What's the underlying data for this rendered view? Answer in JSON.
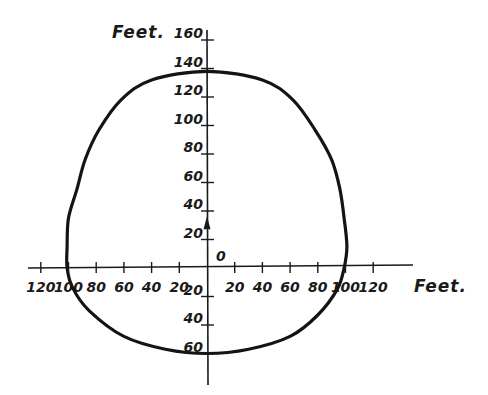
{
  "chart_data": {
    "type": "line",
    "title": "",
    "xlabel": "Feet.",
    "ylabel": "Feet.",
    "origin_label": "0",
    "xlim": [
      -130,
      150
    ],
    "ylim": [
      -75,
      165
    ],
    "grid": false,
    "legend": "none",
    "x_ticks": [
      {
        "value": -120,
        "label": "120"
      },
      {
        "value": -100,
        "label": "100"
      },
      {
        "value": -80,
        "label": "80"
      },
      {
        "value": -60,
        "label": "60"
      },
      {
        "value": -40,
        "label": "40"
      },
      {
        "value": -20,
        "label": "20"
      },
      {
        "value": 20,
        "label": "20"
      },
      {
        "value": 40,
        "label": "40"
      },
      {
        "value": 60,
        "label": "60"
      },
      {
        "value": 80,
        "label": "80"
      },
      {
        "value": 100,
        "label": "100"
      },
      {
        "value": 120,
        "label": "120"
      }
    ],
    "y_ticks": [
      {
        "value": 160,
        "label": "160"
      },
      {
        "value": 140,
        "label": "140"
      },
      {
        "value": 120,
        "label": "120"
      },
      {
        "value": 100,
        "label": "100"
      },
      {
        "value": 80,
        "label": "80"
      },
      {
        "value": 60,
        "label": "60"
      },
      {
        "value": 40,
        "label": "40"
      },
      {
        "value": 20,
        "label": "20"
      },
      {
        "value": -20,
        "label": "20"
      },
      {
        "value": -40,
        "label": "40"
      },
      {
        "value": -60,
        "label": "60"
      }
    ],
    "marker": {
      "type": "arrow-up",
      "x": 0,
      "y": 30
    },
    "series": [
      {
        "name": "closed curve",
        "closed": true,
        "points": [
          {
            "x": 0,
            "y": 138
          },
          {
            "x": 40,
            "y": 132
          },
          {
            "x": 62,
            "y": 118
          },
          {
            "x": 78,
            "y": 97
          },
          {
            "x": 90,
            "y": 76
          },
          {
            "x": 96,
            "y": 55
          },
          {
            "x": 99,
            "y": 35
          },
          {
            "x": 101,
            "y": 15
          },
          {
            "x": 99,
            "y": 0
          },
          {
            "x": 94,
            "y": -15
          },
          {
            "x": 80,
            "y": -33
          },
          {
            "x": 60,
            "y": -48
          },
          {
            "x": 30,
            "y": -57
          },
          {
            "x": 0,
            "y": -60
          },
          {
            "x": -30,
            "y": -57
          },
          {
            "x": -60,
            "y": -48
          },
          {
            "x": -85,
            "y": -30
          },
          {
            "x": -97,
            "y": -14
          },
          {
            "x": -101,
            "y": 0
          },
          {
            "x": -101,
            "y": 15
          },
          {
            "x": -100,
            "y": 35
          },
          {
            "x": -94,
            "y": 55
          },
          {
            "x": -88,
            "y": 76
          },
          {
            "x": -78,
            "y": 97
          },
          {
            "x": -62,
            "y": 118
          },
          {
            "x": -40,
            "y": 132
          }
        ]
      }
    ]
  }
}
